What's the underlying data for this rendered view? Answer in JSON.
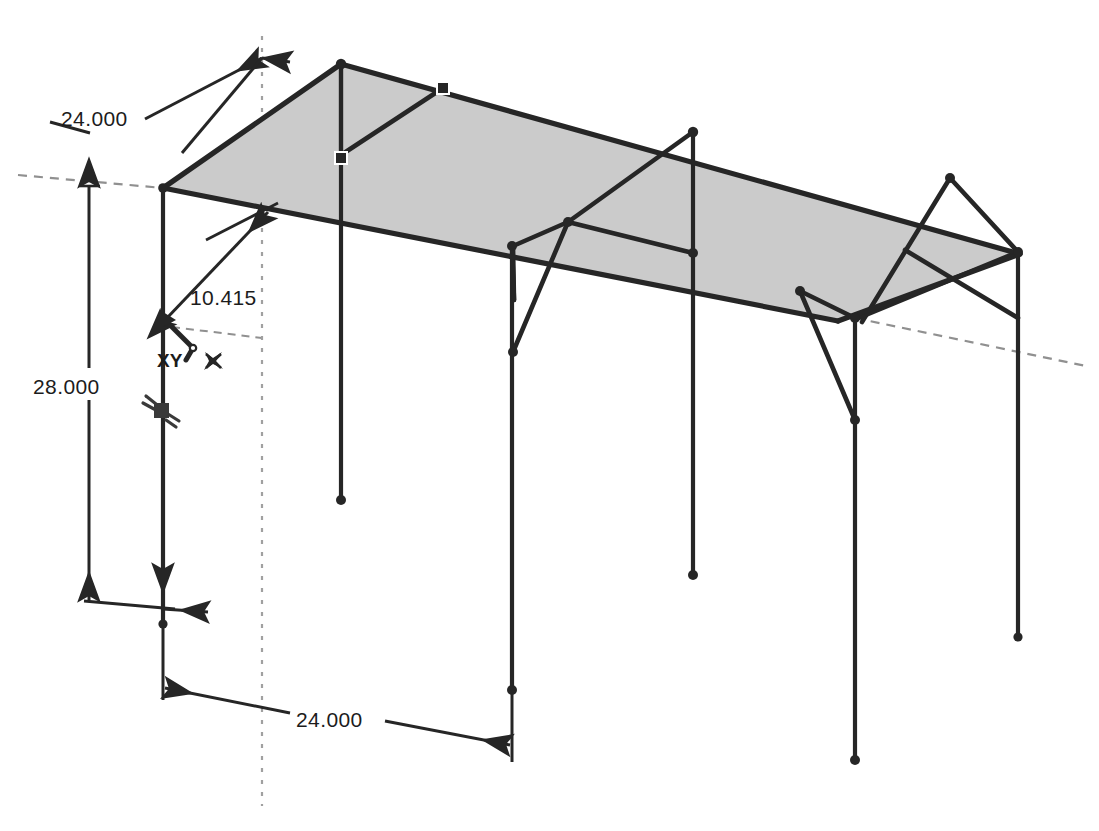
{
  "drawing": {
    "title": "isometric-frame-structure",
    "background_color": "#ffffff",
    "line_color": "#262626",
    "plane_fill_color": "#cbcbcb",
    "plane_stroke_color": "#262626",
    "dim_line_color": "#2a2a2a",
    "reference_line_color": "#8a8a8a"
  },
  "dimensions": {
    "top_width": "24.000",
    "bay_length": "24.000",
    "column_height": "28.000",
    "brace_length": "10.415"
  },
  "labels": {
    "origin_plane": "XY",
    "origin_icon": "origin-axis-icon",
    "star_icon": "fixed-point-icon",
    "support_icon": "pin-support-icon"
  },
  "geometry": {
    "roof_plane_points": "163,188 341,64 1020,254 838,321",
    "top_back_edge": "341,64 1020,254",
    "top_front_edge": "163,188 838,321",
    "left_end_edge": "163,188 341,64",
    "right_end_edge": "838,321 1020,254",
    "columns": [
      {
        "name": "column-front-left",
        "x1": 163,
        "y1": 188,
        "x2": 163,
        "y2": 624
      },
      {
        "name": "column-back-left",
        "x1": 341,
        "y1": 64,
        "x2": 341,
        "y2": 500
      },
      {
        "name": "column-front-mid",
        "x1": 512,
        "y1": 246,
        "x2": 512,
        "y2": 690
      },
      {
        "name": "column-back-mid",
        "x1": 693,
        "y1": 132,
        "x2": 693,
        "y2": 575
      },
      {
        "name": "column-front-right",
        "x1": 855,
        "y1": 318,
        "x2": 855,
        "y2": 760
      },
      {
        "name": "column-back-right",
        "x1": 1018,
        "y1": 252,
        "x2": 1018,
        "y2": 637
      }
    ],
    "braces": [
      {
        "name": "brace-left-roof-diagonal",
        "x1": 341,
        "y1": 64,
        "x2": 341,
        "y2": 155
      },
      {
        "name": "brace-left-roof-diagonal-2",
        "x1": 341,
        "y1": 155,
        "x2": 440,
        "y2": 86
      },
      {
        "name": "brace-mid-knee-a",
        "x1": 693,
        "y1": 132,
        "x2": 568,
        "y2": 222
      },
      {
        "name": "brace-mid-knee-b",
        "x1": 568,
        "y1": 222,
        "x2": 512,
        "y2": 246
      },
      {
        "name": "brace-mid-knee-c",
        "x1": 568,
        "y1": 222,
        "x2": 693,
        "y2": 253
      },
      {
        "name": "brace-mid-knee-d",
        "x1": 512,
        "y1": 246,
        "x2": 513,
        "y2": 352
      },
      {
        "name": "brace-right-x-a",
        "x1": 950,
        "y1": 178,
        "x2": 862,
        "y2": 320
      },
      {
        "name": "brace-right-x-b",
        "x1": 1018,
        "y1": 252,
        "x2": 862,
        "y2": 320
      }
    ]
  },
  "annotations": {
    "dashed_reference_left": "visible",
    "dashed_reference_right": "visible",
    "dashed_vertical_center": "visible"
  }
}
